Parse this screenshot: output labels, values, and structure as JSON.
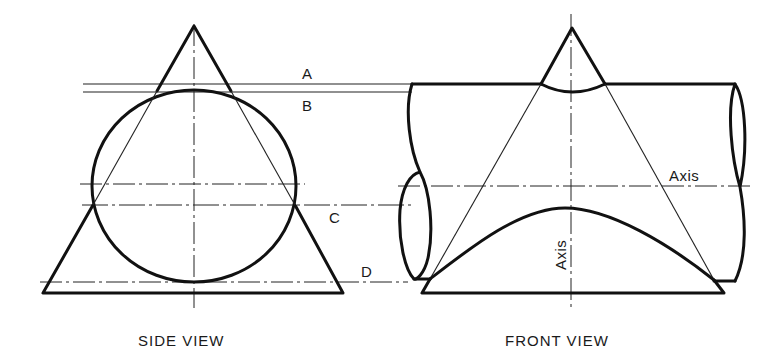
{
  "figure": {
    "side_view": {
      "caption": "SIDE VIEW",
      "cutting_plane_labels": [
        "A",
        "B",
        "C",
        "D"
      ]
    },
    "front_view": {
      "caption": "FRONT VIEW",
      "horizontal_axis_label": "Axis",
      "vertical_axis_label": "Axis"
    },
    "colors": {
      "line": "#111111",
      "background": "#ffffff"
    }
  }
}
